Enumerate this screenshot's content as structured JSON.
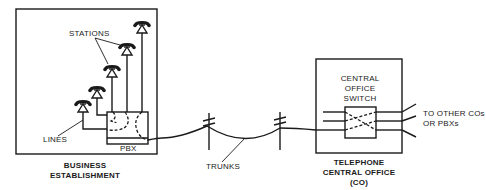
{
  "diagram": {
    "type": "telephone network topology",
    "labels": {
      "stations": "STATIONS",
      "lines": "LINES",
      "pbx": "PBX",
      "business_line1": "BUSINESS",
      "business_line2": "ESTABLISHMENT",
      "trunks": "TRUNKS",
      "switch_line1": "CENTRAL",
      "switch_line2": "OFFICE",
      "switch_line3": "SWITCH",
      "co_line1": "TELEPHONE",
      "co_line2": "CENTRAL OFFICE",
      "co_line3": "(CO)",
      "other_line1": "TO OTHER COs",
      "other_line2": "OR PBXs"
    },
    "nodes": [
      {
        "id": "business-establishment",
        "contains": [
          "stations",
          "pbx"
        ]
      },
      {
        "id": "pbx",
        "parent": "business-establishment"
      },
      {
        "id": "stations",
        "count": 5,
        "icon": "telephone-icon"
      },
      {
        "id": "trunk-poles",
        "count": 2,
        "icon": "utility-pole-icon"
      },
      {
        "id": "telephone-central-office",
        "contains": [
          "central-office-switch"
        ]
      },
      {
        "id": "central-office-switch",
        "parent": "telephone-central-office"
      }
    ],
    "edges": [
      {
        "from": "stations",
        "to": "pbx",
        "label": "LINES"
      },
      {
        "from": "pbx",
        "to": "central-office-switch",
        "label": "TRUNKS"
      },
      {
        "from": "central-office-switch",
        "to": "other-cos-pbxs",
        "label": "TO OTHER COs OR PBXs"
      }
    ],
    "colors": {
      "ink": "#1a1a1a",
      "background": "#ffffff"
    }
  }
}
